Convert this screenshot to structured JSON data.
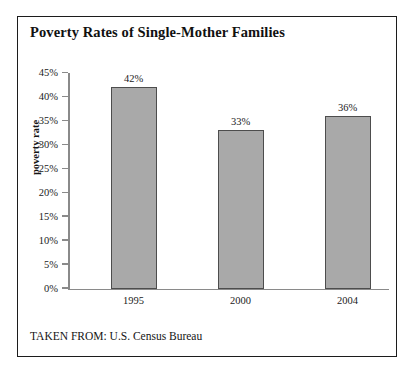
{
  "figure": {
    "title": "Poverty Rates of Single-Mother Families",
    "source_note": "TAKEN FROM: U.S. Census Bureau"
  },
  "colors": {
    "bar_fill": "#a9a9a9",
    "bar_stroke": "#4d4d4d",
    "axis": "#8a8a8a",
    "frame": "#1c1c1c",
    "text": "#1b1b1b",
    "background": "#ffffff"
  },
  "chart_data": {
    "type": "bar",
    "title": "Poverty Rates of Single-Mother Families",
    "subtitle": "",
    "xlabel": "",
    "ylabel": "poverty rate",
    "categories": [
      "1995",
      "2000",
      "2004"
    ],
    "values": [
      42,
      33,
      36
    ],
    "value_labels": [
      "42%",
      "33%",
      "36%"
    ],
    "ylim": [
      0,
      45
    ],
    "ytick_values": [
      0,
      5,
      10,
      15,
      20,
      25,
      30,
      35,
      40,
      45
    ],
    "ytick_labels": [
      "0%",
      "5%",
      "10%",
      "15%",
      "20%",
      "25%",
      "30%",
      "35%",
      "40%",
      "45%"
    ],
    "units": "percent",
    "grid": false,
    "legend": false,
    "annotations": [
      "TAKEN FROM: U.S. Census Bureau"
    ]
  }
}
